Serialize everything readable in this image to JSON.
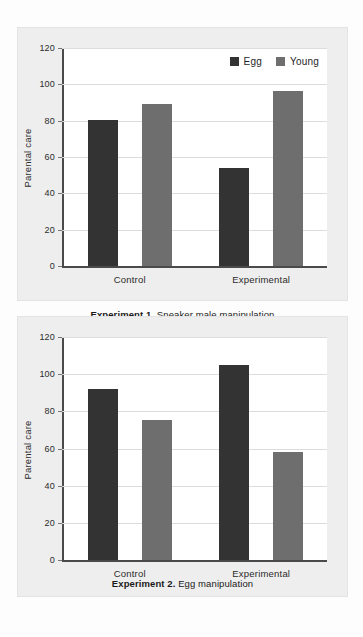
{
  "figure": {
    "background_color": "#eeeeee",
    "plot_background_color": "#ffffff",
    "egg_color": "#333333",
    "young_color": "#6e6e6e"
  },
  "legend": {
    "egg_label": "Egg",
    "young_label": "Young"
  },
  "panel1": {
    "caption_bold": "Experiment 1.",
    "caption_rest": " Sneaker male manipulation"
  },
  "panel2": {
    "caption_bold": "Experiment 2.",
    "caption_rest": " Egg manipulation"
  },
  "chart_data": [
    {
      "id": "experiment-1",
      "type": "bar",
      "title": "Experiment 1. Sneaker male manipulation",
      "xlabel": "",
      "ylabel": "Parental care",
      "categories": [
        "Control",
        "Experimental"
      ],
      "ylim": [
        0,
        120
      ],
      "yticks": [
        0,
        20,
        40,
        60,
        80,
        100,
        120
      ],
      "ytick_labels": [
        "0",
        "20",
        "40",
        "60",
        "80",
        "100",
        "120"
      ],
      "grid": true,
      "legend_position": "top-right",
      "series": [
        {
          "name": "Egg",
          "color": "#333333",
          "values": [
            80.5,
            54.0
          ]
        },
        {
          "name": "Young",
          "color": "#6e6e6e",
          "values": [
            89.0,
            96.5
          ]
        }
      ]
    },
    {
      "id": "experiment-2",
      "type": "bar",
      "title": "Experiment 2. Egg manipulation",
      "xlabel": "",
      "ylabel": "Parental care",
      "categories": [
        "Control",
        "Experimental"
      ],
      "ylim": [
        0,
        120
      ],
      "yticks": [
        0,
        20,
        40,
        60,
        80,
        100,
        120
      ],
      "ytick_labels": [
        "0",
        "20",
        "40",
        "60",
        "80",
        "100",
        "120"
      ],
      "grid": true,
      "legend_position": "none",
      "series": [
        {
          "name": "Egg",
          "color": "#333333",
          "values": [
            92.0,
            105.0
          ]
        },
        {
          "name": "Young",
          "color": "#6e6e6e",
          "values": [
            75.5,
            58.0
          ]
        }
      ]
    }
  ]
}
